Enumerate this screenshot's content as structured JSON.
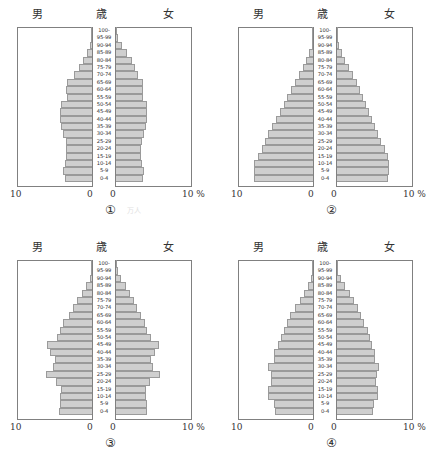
{
  "figure": {
    "headers": {
      "male": "男",
      "age": "歳",
      "female": "女"
    },
    "axis": {
      "left_outer": "10",
      "left_inner": "0",
      "right_inner": "0",
      "right_outer": "10 %"
    },
    "artifact_mark": "万人"
  },
  "age_groups": [
    "100-",
    "95-99",
    "90-94",
    "85-89",
    "80-84",
    "75-79",
    "70-74",
    "65-69",
    "60-64",
    "55-59",
    "50-54",
    "45-49",
    "40-44",
    "35-39",
    "30-34",
    "25-29",
    "20-24",
    "15-19",
    "10-14",
    "5-9",
    "0-4"
  ],
  "colors": {
    "bar_fill": "#cfcfcf",
    "bar_stroke": "#9a9a9a",
    "axis_line": "#808080",
    "text": "#333333"
  },
  "chart_data": [
    {
      "type": "bar",
      "id": "1",
      "caption": "①",
      "title": "人口ピラミッド ①",
      "orientation": "horizontal-diverging",
      "xlabel": "%",
      "ylabel": "歳",
      "xlim": [
        0,
        10
      ],
      "grid": false,
      "categories": [
        "100-",
        "95-99",
        "90-94",
        "85-89",
        "80-84",
        "75-79",
        "70-74",
        "65-69",
        "60-64",
        "55-59",
        "50-54",
        "45-49",
        "40-44",
        "35-39",
        "30-34",
        "25-29",
        "20-24",
        "15-19",
        "10-14",
        "5-9",
        "0-4"
      ],
      "series": [
        {
          "name": "男",
          "side": "left",
          "values": [
            0.05,
            0.15,
            0.35,
            0.8,
            1.3,
            1.9,
            2.5,
            3.4,
            3.5,
            3.4,
            4.2,
            4.3,
            4.3,
            4.2,
            3.9,
            3.6,
            3.5,
            3.5,
            3.7,
            3.9,
            3.7
          ]
        },
        {
          "name": "女",
          "side": "right",
          "values": [
            0.12,
            0.4,
            0.9,
            1.5,
            2.2,
            2.6,
            3.0,
            3.7,
            3.7,
            3.6,
            4.2,
            4.2,
            4.2,
            4.0,
            3.8,
            3.5,
            3.4,
            3.4,
            3.5,
            3.8,
            3.6
          ]
        }
      ]
    },
    {
      "type": "bar",
      "id": "2",
      "caption": "②",
      "title": "人口ピラミッド ②",
      "orientation": "horizontal-diverging",
      "xlabel": "%",
      "ylabel": "歳",
      "xlim": [
        0,
        10
      ],
      "grid": false,
      "categories": [
        "100-",
        "95-99",
        "90-94",
        "85-89",
        "80-84",
        "75-79",
        "70-74",
        "65-69",
        "60-64",
        "55-59",
        "50-54",
        "45-49",
        "40-44",
        "35-39",
        "30-34",
        "25-29",
        "20-24",
        "15-19",
        "10-14",
        "5-9",
        "0-4"
      ],
      "series": [
        {
          "name": "男",
          "side": "left",
          "values": [
            0.05,
            0.1,
            0.3,
            0.6,
            1.0,
            1.5,
            2.0,
            2.5,
            3.0,
            3.5,
            4.0,
            4.5,
            5.0,
            5.5,
            6.0,
            6.4,
            6.9,
            7.4,
            7.9,
            7.9,
            7.9
          ]
        },
        {
          "name": "女",
          "side": "right",
          "values": [
            0.08,
            0.2,
            0.45,
            0.8,
            1.2,
            1.7,
            2.2,
            2.7,
            3.1,
            3.5,
            3.9,
            4.3,
            4.7,
            5.1,
            5.5,
            5.9,
            6.3,
            6.7,
            6.9,
            6.9,
            6.8
          ]
        }
      ]
    },
    {
      "type": "bar",
      "id": "3",
      "caption": "③",
      "title": "人口ピラミッド ③",
      "orientation": "horizontal-diverging",
      "xlabel": "%",
      "ylabel": "歳",
      "xlim": [
        0,
        10
      ],
      "grid": false,
      "categories": [
        "100-",
        "95-99",
        "90-94",
        "85-89",
        "80-84",
        "75-79",
        "70-74",
        "65-69",
        "60-64",
        "55-59",
        "50-54",
        "45-49",
        "40-44",
        "35-39",
        "30-34",
        "25-29",
        "20-24",
        "15-19",
        "10-14",
        "5-9",
        "0-4"
      ],
      "series": [
        {
          "name": "男",
          "side": "left",
          "values": [
            0.05,
            0.15,
            0.4,
            0.9,
            1.5,
            2.1,
            2.6,
            3.2,
            3.9,
            4.3,
            4.8,
            6.1,
            5.6,
            5.0,
            5.3,
            6.2,
            4.9,
            4.2,
            4.3,
            4.4,
            4.5
          ]
        },
        {
          "name": "女",
          "side": "right",
          "values": [
            0.1,
            0.35,
            0.8,
            1.4,
            2.0,
            2.5,
            2.9,
            3.4,
            3.9,
            4.2,
            4.7,
            5.7,
            5.2,
            4.7,
            4.9,
            5.8,
            4.6,
            4.0,
            4.0,
            4.1,
            4.2
          ]
        }
      ]
    },
    {
      "type": "bar",
      "id": "4",
      "caption": "④",
      "title": "人口ピラミッド ④",
      "orientation": "horizontal-diverging",
      "xlabel": "%",
      "ylabel": "歳",
      "xlim": [
        0,
        10
      ],
      "grid": false,
      "categories": [
        "100-",
        "95-99",
        "90-94",
        "85-89",
        "80-84",
        "75-79",
        "70-74",
        "65-69",
        "60-64",
        "55-59",
        "50-54",
        "45-49",
        "40-44",
        "35-39",
        "30-34",
        "25-29",
        "20-24",
        "15-19",
        "10-14",
        "5-9",
        "0-4"
      ],
      "series": [
        {
          "name": "男",
          "side": "left",
          "values": [
            0.05,
            0.15,
            0.4,
            0.8,
            1.3,
            1.9,
            2.5,
            3.1,
            3.6,
            4.0,
            4.4,
            4.8,
            5.2,
            5.2,
            6.0,
            5.7,
            5.6,
            6.0,
            6.0,
            5.2,
            5.1
          ]
        },
        {
          "name": "女",
          "side": "right",
          "values": [
            0.1,
            0.3,
            0.7,
            1.2,
            1.8,
            2.3,
            2.8,
            3.3,
            3.7,
            4.1,
            4.4,
            4.7,
            5.0,
            5.0,
            5.6,
            5.3,
            5.2,
            5.5,
            5.5,
            4.9,
            4.8
          ]
        }
      ]
    }
  ]
}
